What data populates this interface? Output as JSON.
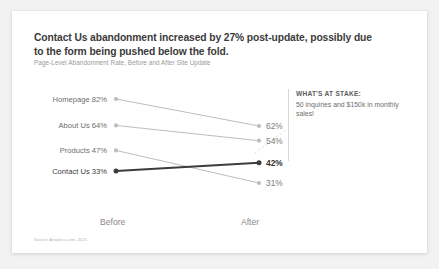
{
  "card": {
    "title": "Contact Us abandonment increased by 27% post-update, possibly due to the form being pushed below the fold.",
    "subtitle": "Page-Level Abandonment Rate, Before and After Site Update",
    "source": "Source: Analytics.com, 2021."
  },
  "callout": {
    "heading": "WHAT'S AT STAKE:",
    "body": "50 inquiries and $150k in monthly sales!"
  },
  "colors": {
    "highlight": "#3c3c3c",
    "muted": "#bdbdbd",
    "card": "#ffffff",
    "background": "#f2f2f2",
    "title_text": "#3b3b3b",
    "subtitle_text": "#9a9a9a"
  },
  "chart_data": {
    "type": "line",
    "title": "Contact Us abandonment increased by 27% post-update, possibly due to the form being pushed below the fold.",
    "subtitle": "Page-Level Abandonment Rate, Before and After Site Update",
    "xlabel": "",
    "ylabel": "",
    "categories": [
      "Before",
      "After"
    ],
    "grid": false,
    "legend": "none",
    "ylim": [
      0,
      100
    ],
    "series": [
      {
        "name": "Homepage",
        "values": [
          82,
          62
        ],
        "left_label": "Homepage 82%",
        "right_label": "62%",
        "highlight": false
      },
      {
        "name": "About Us",
        "values": [
          64,
          54
        ],
        "left_label": "About Us 64%",
        "right_label": "54%",
        "highlight": false
      },
      {
        "name": "Products",
        "values": [
          47,
          31
        ],
        "left_label": "Products 47%",
        "right_label": "31%",
        "highlight": false
      },
      {
        "name": "Contact Us",
        "values": [
          33,
          42
        ],
        "left_label": "Contact Us 33%",
        "right_label": "42%",
        "highlight": true
      }
    ]
  }
}
